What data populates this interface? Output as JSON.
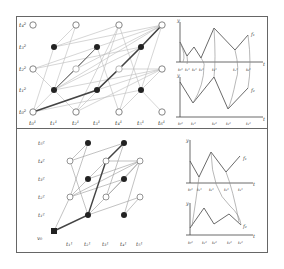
{
  "figure": {
    "top_panel": {
      "grid_labels": {
        "rows": [
          "t0^2",
          "t1^2",
          "t2^2",
          "t3^2",
          "t4^2"
        ],
        "cols": [
          "t0^1",
          "t1^1",
          "t2^1",
          "t3^1",
          "t4^1",
          "t5^1",
          "t6^1"
        ]
      },
      "rows_display": [
        "t₀²",
        "t₁²",
        "t₂²",
        "t₃²",
        "t₄²"
      ],
      "cols_display": [
        "t₀¹",
        "t₁¹",
        "t₂¹",
        "t₃¹",
        "t₄¹",
        "t₅¹",
        "t₆¹"
      ],
      "plot_top": {
        "y_axis": "y",
        "x_axis": "t",
        "curve_label": "f₁",
        "ticks": [
          "t₀¹",
          "t₁¹",
          "t₂¹",
          "t₃¹",
          "t₄¹",
          "t₅¹",
          "t₆¹"
        ]
      },
      "plot_bottom": {
        "y_axis": "y",
        "x_axis": "t",
        "curve_label": "f₂",
        "ticks": [
          "t₀²",
          "t₁²",
          "t₂²",
          "t₃²",
          "t₄²"
        ]
      }
    },
    "bottom_panel": {
      "origin_label": "v₀",
      "rows_display": [
        "t₁²",
        "t₂²",
        "t₃²",
        "t₄²",
        "t₅²"
      ],
      "cols_display": [
        "t₁¹",
        "t₂¹",
        "t₃¹",
        "t₄¹",
        "t₅¹"
      ],
      "plot_top": {
        "y_axis": "y",
        "x_axis": "t",
        "curve_label": "f₁",
        "ticks": [
          "t₀¹",
          "t₁¹",
          "t₂¹",
          "t₃¹",
          "t₄¹"
        ]
      },
      "plot_bottom": {
        "y_axis": "y",
        "x_axis": "t",
        "curve_label": "f₂",
        "ticks": [
          "t₀²",
          "t₁²",
          "t₂²",
          "t₃²",
          "t₄²"
        ]
      }
    }
  }
}
